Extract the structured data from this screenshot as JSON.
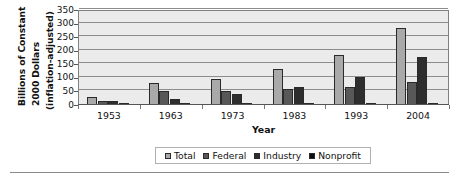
{
  "chart_data": {
    "type": "bar",
    "title": "",
    "xlabel": "Year",
    "ylabel": "Billions of Constant 2000 Dollars (inflation-adjusted)",
    "ylabel_lines": [
      "Billions of Constant",
      "2000 Dollars",
      "(inflation-adjusted)"
    ],
    "categories": [
      "1953",
      "1963",
      "1973",
      "1983",
      "1993",
      "2004"
    ],
    "series": [
      {
        "name": "Total",
        "color": "#a9a9a9",
        "values": [
          28,
          80,
          96,
          133,
          183,
          283
        ]
      },
      {
        "name": "Federal",
        "color": "#585858",
        "values": [
          15,
          52,
          51,
          58,
          65,
          83
        ]
      },
      {
        "name": "Industry",
        "color": "#2e2e2e",
        "values": [
          13,
          24,
          39,
          66,
          105,
          178
        ]
      },
      {
        "name": "Nonprofit",
        "color": "#0d0d0d",
        "values": [
          1,
          1,
          1,
          2,
          2,
          6
        ]
      }
    ],
    "ylim": [
      0,
      350
    ],
    "ytick_values": [
      0,
      50,
      100,
      150,
      200,
      250,
      300,
      350
    ],
    "ytick_labels": [
      "0",
      "50",
      "100",
      "150",
      "200",
      "250",
      "300",
      "350"
    ],
    "grid": true,
    "legend_position": "bottom",
    "plot_background": "#ebebeb",
    "grid_color": "#8c8c8c",
    "bar_border_color": "#2a2a2a"
  }
}
